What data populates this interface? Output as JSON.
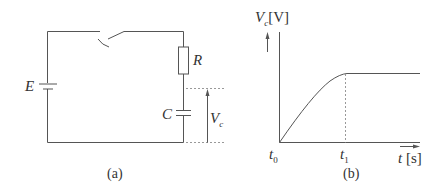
{
  "figure_a": {
    "caption": "(a)",
    "battery_label": "E",
    "resistor_label": "R",
    "capacitor_label": "C",
    "voltage_label_main": "V",
    "voltage_label_sub": "c"
  },
  "figure_b": {
    "caption": "(b)",
    "y_axis_label_main": "V",
    "y_axis_label_sub": "c",
    "y_axis_unit": "[V]",
    "x_axis_label": "t",
    "x_axis_unit": "[s]",
    "t0_main": "t",
    "t0_sub": "0",
    "t1_main": "t",
    "t1_sub": "1"
  },
  "colors": {
    "line": "#555555",
    "dotted": "#999999",
    "text": "#333333"
  }
}
